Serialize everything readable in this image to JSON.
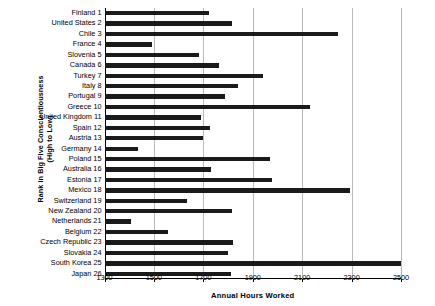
{
  "chart_data": {
    "type": "bar",
    "orientation": "horizontal",
    "title": "",
    "xlabel": "Annual Hours Worked",
    "ylabel": "Rank in Big Five Conscientiousness (High to Low)",
    "ylabel_line1": "Rank in Big Five Conscientiousness",
    "ylabel_line2": "(High to Low)",
    "xlim": [
      1300,
      2500
    ],
    "xticks": [
      1300,
      1500,
      1700,
      1900,
      2100,
      2300,
      2500
    ],
    "xtick_labels": [
      "1300",
      "1500",
      "1700",
      "1900",
      "2100",
      "2300",
      "2500"
    ],
    "grid": "vertical",
    "legend": "none",
    "bar_color": "#1a1a1a",
    "gridline_color": "#b9b9b9",
    "categories": [
      "Finland 1",
      "United States 2",
      "Chile 3",
      "France 4",
      "Slovenia 5",
      "Canada 6",
      "Turkey 7",
      "Italy 8",
      "Portugal 9",
      "Greece 10",
      "United Kingdom 11",
      "Spain 12",
      "Austria 13",
      "Germany 14",
      "Poland 15",
      "Australia 16",
      "Estonia 17",
      "Mexico 18",
      "Switzerland 19",
      "New Zealand 20",
      "Netherlands 21",
      "Belgium 22",
      "Czech Republic 23",
      "Slovakia 24",
      "South Korea 25",
      "Japan 26"
    ],
    "values": [
      1724,
      1814,
      2247,
      1493,
      1683,
      1764,
      1942,
      1842,
      1786,
      2130,
      1690,
      1728,
      1700,
      1436,
      1971,
      1732,
      1979,
      2292,
      1635,
      1814,
      1407,
      1557,
      1822,
      1800,
      2500,
      1810
    ]
  }
}
